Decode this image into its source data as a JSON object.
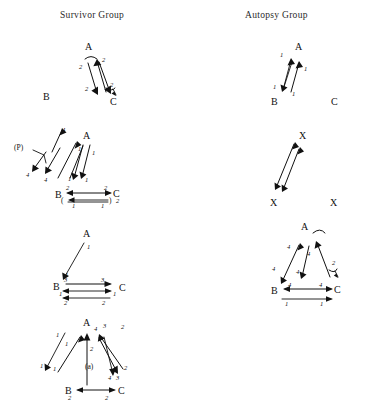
{
  "figure": {
    "caption": "(a)",
    "columns": [
      {
        "id": "survivor",
        "title": "Survivor Group"
      },
      {
        "id": "autopsy",
        "title": "Autopsy Group"
      }
    ],
    "rows": [
      {
        "row": 1,
        "survivor": {
          "nodes": [
            {
              "name": "A",
              "x": 85,
              "y": 46
            },
            {
              "name": "B",
              "x": 43,
              "y": 96
            },
            {
              "name": "C",
              "x": 110,
              "y": 101
            }
          ],
          "edge_labels": [
            "2",
            "2",
            "2",
            "2"
          ],
          "has_self_loop": true
        },
        "autopsy": {
          "nodes": [
            {
              "name": "A",
              "x": 295,
              "y": 46
            },
            {
              "name": "B",
              "x": 271,
              "y": 101
            },
            {
              "name": "C",
              "x": 331,
              "y": 101
            }
          ],
          "edge_labels": [
            "1",
            "1",
            "1",
            "1"
          ],
          "has_self_loop": false
        }
      },
      {
        "row": 2,
        "survivor": {
          "nodes": [
            {
              "name": "A",
              "x": 83,
              "y": 135
            },
            {
              "name": "B",
              "x": 55,
              "y": 194
            },
            {
              "name": "C",
              "x": 113,
              "y": 193
            }
          ],
          "annotation": "(P)",
          "edge_labels": [
            "4",
            "4",
            "4",
            "1",
            "1",
            "1",
            "1",
            "2",
            "2",
            "1",
            "1",
            "2"
          ],
          "has_bracket": true
        },
        "autopsy": {
          "nodes": [
            {
              "name": "X",
              "x": 299,
              "y": 135
            },
            {
              "name": "X",
              "x": 270,
              "y": 202
            },
            {
              "name": "X",
              "x": 330,
              "y": 202
            }
          ],
          "edge_labels": [],
          "has_self_loop": false
        }
      },
      {
        "row": 3,
        "survivor": {
          "nodes": [
            {
              "name": "A",
              "x": 83,
              "y": 233
            },
            {
              "name": "B",
              "x": 53,
              "y": 286
            },
            {
              "name": "C",
              "x": 119,
              "y": 287
            }
          ],
          "edge_labels": [
            "1",
            "1",
            "3",
            "3",
            "1",
            "1",
            "2",
            "2"
          ]
        },
        "autopsy": {
          "nodes": [
            {
              "name": "A",
              "x": 301,
              "y": 226
            },
            {
              "name": "B",
              "x": 271,
              "y": 290
            },
            {
              "name": "C",
              "x": 334,
              "y": 289
            }
          ],
          "edge_labels": [
            "4",
            "4",
            "4",
            "4",
            "4",
            "4",
            "2",
            "1",
            "1"
          ],
          "has_self_loop": true
        }
      },
      {
        "row": 4,
        "survivor": {
          "nodes": [
            {
              "name": "A",
              "x": 83,
              "y": 322
            },
            {
              "name": "B",
              "x": 65,
              "y": 390
            },
            {
              "name": "C",
              "x": 118,
              "y": 390
            }
          ],
          "caption": "(a)",
          "edge_labels": [
            "1",
            "1",
            "1",
            "1",
            "2",
            "4",
            "3",
            "2",
            "2",
            "4",
            "3",
            "2",
            "2"
          ]
        },
        "autopsy": null
      }
    ]
  }
}
